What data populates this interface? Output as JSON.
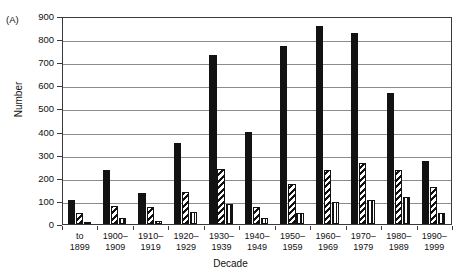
{
  "panel": {
    "label": "(A)"
  },
  "top_artifact": {
    "text": ""
  },
  "axes": {
    "ylabel": "Number",
    "xlabel": "Decade",
    "yticks": [
      "0",
      "100",
      "200",
      "300",
      "400",
      "500",
      "600",
      "700",
      "800",
      "900"
    ]
  },
  "chart_data": {
    "type": "bar",
    "title": "",
    "xlabel": "Decade",
    "ylabel": "Number",
    "ylim": [
      0,
      900
    ],
    "ytick_step": 100,
    "grid": true,
    "legend": "none",
    "grouped": true,
    "categories": [
      "to 1899",
      "1900–1909",
      "1910–1919",
      "1920–1929",
      "1930–1939",
      "1940–1949",
      "1950–1959",
      "1960–1969",
      "1970–1979",
      "1980–1989",
      "1990–1999"
    ],
    "category_lines": [
      [
        "to",
        "1899"
      ],
      [
        "1900–",
        "1909"
      ],
      [
        "1910–",
        "1919"
      ],
      [
        "1920–",
        "1929"
      ],
      [
        "1930–",
        "1939"
      ],
      [
        "1940–",
        "1949"
      ],
      [
        "1950–",
        "1959"
      ],
      [
        "1960–",
        "1969"
      ],
      [
        "1970–",
        "1979"
      ],
      [
        "1980–",
        "1989"
      ],
      [
        "1990–",
        "1999"
      ]
    ],
    "series": [
      {
        "name": "series-1",
        "fill": "solid-black",
        "color": "#121212",
        "values": [
          105,
          235,
          135,
          350,
          730,
          398,
          772,
          855,
          825,
          565,
          272
        ]
      },
      {
        "name": "series-2",
        "fill": "diagonal-hatch",
        "color": "#121212",
        "values": [
          48,
          78,
          72,
          138,
          240,
          75,
          175,
          235,
          265,
          235,
          160
        ]
      },
      {
        "name": "series-3",
        "fill": "vertical-hatch",
        "color": "#121212",
        "values": [
          10,
          25,
          15,
          50,
          88,
          28,
          48,
          95,
          105,
          115,
          48
        ]
      }
    ]
  }
}
